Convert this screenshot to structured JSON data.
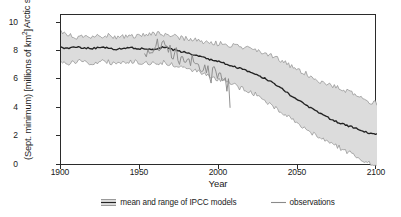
{
  "chart_data": {
    "type": "line",
    "title": "",
    "xlabel": "Year",
    "ylabel_line1": "Arctic sea ice extent",
    "ylabel_line2": "(Sept. minimum) [millions of km",
    "ylabel_line2_sup": "2",
    "ylabel_line2_end": "]",
    "xlim": [
      1900,
      2100
    ],
    "ylim": [
      0,
      10.8
    ],
    "xticks": [
      1900,
      1950,
      2000,
      2050,
      2100
    ],
    "yticks": [
      0,
      2,
      4,
      6,
      8,
      10
    ],
    "grid": false,
    "legend_position": "below-axes",
    "colors": {
      "band_fill": "#dcdcdc",
      "band_edge": "#8c8c8c",
      "mean_line": "#232323",
      "observations_line": "#8a8a8a",
      "axis": "#2b2b2b",
      "text": "#1a1a1a"
    },
    "series": [
      {
        "name": "mean and range of IPCC models",
        "kind": "band-with-mean",
        "x": [
          1900,
          1905,
          1910,
          1915,
          1920,
          1925,
          1930,
          1935,
          1940,
          1945,
          1950,
          1955,
          1960,
          1965,
          1970,
          1975,
          1980,
          1985,
          1990,
          1995,
          2000,
          2005,
          2010,
          2015,
          2020,
          2025,
          2030,
          2035,
          2040,
          2045,
          2050,
          2055,
          2060,
          2065,
          2070,
          2075,
          2080,
          2085,
          2090,
          2095,
          2100
        ],
        "mean": [
          8.45,
          8.4,
          8.5,
          8.45,
          8.4,
          8.5,
          8.45,
          8.35,
          8.4,
          8.45,
          8.4,
          8.35,
          8.4,
          8.5,
          8.35,
          8.2,
          8.1,
          7.95,
          7.8,
          7.6,
          7.45,
          7.3,
          7.1,
          6.9,
          6.75,
          6.5,
          6.2,
          5.9,
          5.55,
          5.1,
          4.7,
          4.35,
          4.0,
          3.7,
          3.4,
          3.15,
          2.95,
          2.75,
          2.55,
          2.35,
          2.3
        ],
        "upper": [
          9.6,
          9.35,
          9.2,
          9.35,
          9.25,
          9.3,
          9.4,
          9.2,
          9.3,
          9.25,
          9.3,
          9.35,
          9.45,
          9.4,
          9.3,
          9.2,
          9.1,
          9.0,
          8.9,
          8.8,
          8.75,
          8.7,
          8.6,
          8.5,
          8.4,
          8.2,
          8.0,
          7.8,
          7.5,
          7.2,
          6.9,
          6.6,
          6.3,
          6.0,
          5.8,
          5.6,
          5.4,
          5.2,
          4.9,
          4.6,
          4.5
        ],
        "lower": [
          7.45,
          7.3,
          7.5,
          7.4,
          7.3,
          7.5,
          7.45,
          7.3,
          7.4,
          7.45,
          7.4,
          7.3,
          7.35,
          7.4,
          7.25,
          7.1,
          6.95,
          6.8,
          6.6,
          6.4,
          6.2,
          6.0,
          5.75,
          5.5,
          5.3,
          5.0,
          4.6,
          4.2,
          3.8,
          3.4,
          3.0,
          2.6,
          2.3,
          2.0,
          1.7,
          1.4,
          1.1,
          0.8,
          0.5,
          0.2,
          0.0
        ]
      },
      {
        "name": "observations",
        "kind": "line",
        "x": [
          1953,
          1955,
          1957,
          1959,
          1961,
          1963,
          1965,
          1967,
          1969,
          1971,
          1973,
          1975,
          1977,
          1979,
          1981,
          1983,
          1985,
          1987,
          1989,
          1991,
          1993,
          1995,
          1997,
          1999,
          2001,
          2003,
          2005,
          2006,
          2007
        ],
        "y": [
          8.3,
          8.1,
          8.55,
          8.2,
          8.9,
          8.35,
          8.6,
          8.2,
          8.45,
          7.9,
          8.2,
          7.6,
          7.9,
          7.5,
          7.3,
          7.6,
          7.1,
          7.45,
          7.0,
          6.9,
          7.2,
          6.4,
          6.9,
          6.3,
          6.7,
          6.1,
          5.6,
          5.9,
          4.2
        ]
      }
    ],
    "legend": [
      {
        "label": "mean and range of IPCC models",
        "swatch": "hatched-band-swatch"
      },
      {
        "label": "observations",
        "swatch": "line-swatch"
      }
    ]
  }
}
